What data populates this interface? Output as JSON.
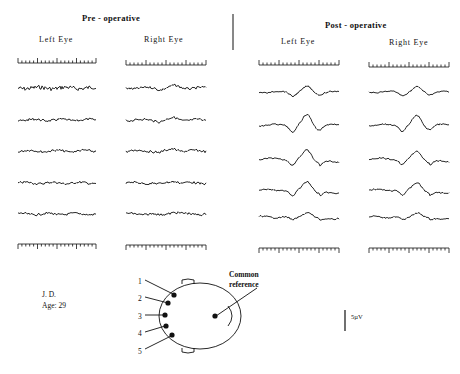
{
  "figure": {
    "pre_title": "Pre - operative",
    "post_title": "Post - operative",
    "pre_left_label": "Left  Eye",
    "pre_right_label": "Right  Eye",
    "post_left_label": "Left  Eye",
    "post_right_label": "Right  Eye",
    "patient_initials": "J. D.",
    "patient_age": "Age: 29",
    "scale_label": "5µV",
    "reference_label_line1": "Common",
    "reference_label_line2": "reference",
    "electrode_labels": [
      "1",
      "2",
      "3",
      "4",
      "5"
    ]
  },
  "panels": [
    {
      "name": "pre-left",
      "x0": 18,
      "x1": 96,
      "traces": 5,
      "response_amplitude": 0
    },
    {
      "name": "pre-right",
      "x0": 126,
      "x1": 206,
      "traces": 5,
      "response_amplitude": 0.4
    },
    {
      "name": "post-left",
      "x0": 259,
      "x1": 339,
      "traces": 5,
      "response_amplitude": 1.0
    },
    {
      "name": "post-right",
      "x0": 369,
      "x1": 449,
      "traces": 5,
      "response_amplitude": 0.9
    }
  ],
  "colors": {
    "ink": "#111111",
    "background": "#ffffff"
  }
}
